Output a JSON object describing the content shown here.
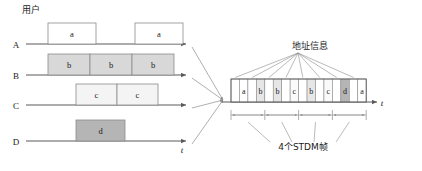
{
  "figure": {
    "title_left": "用户",
    "axis_label_time": "t",
    "address_info_label": "地址信息",
    "frames_label": "4个STDM帧"
  },
  "colors": {
    "line": "#5a5a5a",
    "box_white": "#ffffff",
    "box_light": "#f4f4f4",
    "box_gray": "#d8d8d8",
    "box_dark": "#b5b5b5",
    "text": "#1a1a1a",
    "thin": "#8c8c8c"
  },
  "left_panel": {
    "rows": [
      {
        "name": "A",
        "fill": "#ffffff",
        "blocks": [
          {
            "label": "a",
            "x": 48,
            "w": 48
          },
          {
            "label": "a",
            "x": 135,
            "w": 48
          }
        ]
      },
      {
        "name": "B",
        "fill": "#d8d8d8",
        "blocks": [
          {
            "label": "b",
            "x": 48,
            "w": 42
          },
          {
            "label": "b",
            "x": 90,
            "w": 42
          },
          {
            "label": "b",
            "x": 132,
            "w": 42
          }
        ]
      },
      {
        "name": "C",
        "fill": "#f4f4f4",
        "blocks": [
          {
            "label": "c",
            "x": 76,
            "w": 41
          },
          {
            "label": "c",
            "x": 117,
            "w": 41
          }
        ]
      },
      {
        "name": "D",
        "fill": "#b5b5b5",
        "blocks": [
          {
            "label": "d",
            "x": 76,
            "w": 49
          }
        ]
      }
    ]
  },
  "right_panel": {
    "cells": [
      {
        "label": "",
        "fill": "#ffffff"
      },
      {
        "label": "a",
        "fill": "#ffffff"
      },
      {
        "label": "",
        "fill": "#ffffff"
      },
      {
        "label": "b",
        "fill": "#e6e6e6"
      },
      {
        "label": "",
        "fill": "#ffffff"
      },
      {
        "label": "b",
        "fill": "#e6e6e6"
      },
      {
        "label": "",
        "fill": "#ffffff"
      },
      {
        "label": "c",
        "fill": "#fafafa"
      },
      {
        "label": "",
        "fill": "#ffffff"
      },
      {
        "label": "b",
        "fill": "#e6e6e6"
      },
      {
        "label": "",
        "fill": "#ffffff"
      },
      {
        "label": "c",
        "fill": "#fafafa"
      },
      {
        "label": "",
        "fill": "#ffffff"
      },
      {
        "label": "d",
        "fill": "#b5b5b5"
      },
      {
        "label": "",
        "fill": "#ffffff"
      },
      {
        "label": "a",
        "fill": "#ffffff"
      }
    ],
    "frame_count": 4,
    "address_pointer_count": 8
  }
}
